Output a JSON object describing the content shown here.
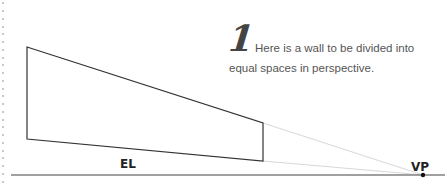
{
  "step": {
    "number": "1",
    "text": "Here is a wall to be divided into equal spaces in perspective."
  },
  "labels": {
    "eye_level": "EL",
    "vanishing_point": "VP"
  },
  "geometry": {
    "wall": {
      "top_left": [
        27,
        47
      ],
      "bottom_left": [
        27,
        139
      ],
      "top_right": [
        263,
        123
      ],
      "bottom_right": [
        263,
        161
      ]
    },
    "vanishing_point": [
      423,
      175
    ],
    "horizon_line": {
      "x1": 11,
      "x2": 445,
      "y": 175
    }
  },
  "colors": {
    "wall_stroke": "#333333",
    "horizon": "#808080",
    "guide_lines": "#d8d8d8",
    "text": "#555555",
    "margin_dots": "#c8c8c8"
  }
}
